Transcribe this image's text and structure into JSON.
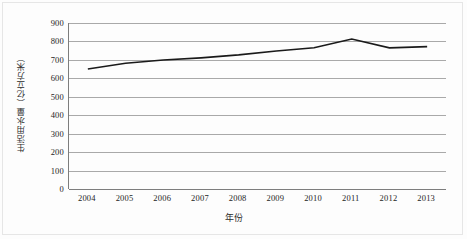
{
  "chart_data": {
    "type": "line",
    "title": "",
    "subtitle": "",
    "xlabel": "年份",
    "ylabel": "生活用水量（亿立方米）",
    "categories": [
      "2004",
      "2005",
      "2006",
      "2007",
      "2008",
      "2009",
      "2010",
      "2011",
      "2012",
      "2013"
    ],
    "x": [
      2004,
      2005,
      2006,
      2007,
      2008,
      2009,
      2010,
      2011,
      2012,
      2013
    ],
    "values": [
      651,
      682,
      699,
      711,
      727,
      748,
      766,
      813,
      765,
      772
    ],
    "series": [
      {
        "name": "生活用水量",
        "values": [
          651,
          682,
          699,
          711,
          727,
          748,
          766,
          813,
          765,
          772
        ],
        "color": "#1a1a1a"
      }
    ],
    "ylim": [
      0,
      900
    ],
    "ytick_values": [
      900,
      800,
      700,
      600,
      500,
      400,
      300,
      200,
      100,
      0
    ],
    "ytick_labels": [
      "900",
      "800",
      "700",
      "600",
      "500",
      "400",
      "300",
      "200",
      "100",
      "0"
    ],
    "xtick_labels": [
      "2004",
      "2005",
      "2006",
      "2007",
      "2008",
      "2009",
      "2010",
      "2011",
      "2012",
      "2013"
    ],
    "grid": true,
    "grid_axis": "y",
    "legend": false,
    "legend_position": "none",
    "line_color": "#1a1a1a",
    "gridline_color": "#a9a9a9",
    "axis_color": "#7d7d7d",
    "background_color": "#ffffff",
    "markers": false
  }
}
